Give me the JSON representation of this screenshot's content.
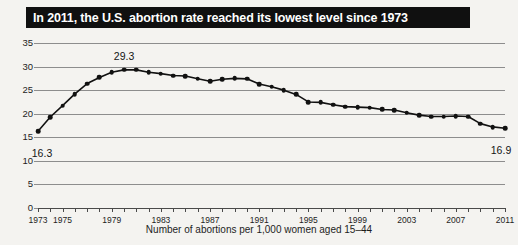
{
  "header": {
    "title": "In 2011, the U.S. abortion rate reached its lowest level since 1973"
  },
  "caption": "Number of abortions per 1,000 women aged 15–44",
  "annotations": {
    "first": "16.3",
    "peak": "29.3",
    "last": "16.9"
  },
  "colors": {
    "banner_background": "#101010",
    "banner_text": "#ffffff",
    "line": "#111111",
    "gridline": "#8d8d8d",
    "page_background": "#f4f3f0"
  },
  "chart_data": {
    "type": "line",
    "title": "In 2011, the U.S. abortion rate reached its lowest level since 1973",
    "xlabel": "Number of abortions per 1,000 women aged 15–44",
    "ylabel": "",
    "ylim": [
      0,
      35
    ],
    "yticks": [
      0,
      5,
      10,
      15,
      20,
      25,
      30,
      35
    ],
    "xlim": [
      1973,
      2011
    ],
    "xticks": [
      1973,
      1974,
      1975,
      1976,
      1977,
      1978,
      1979,
      1980,
      1981,
      1982,
      1983,
      1984,
      1985,
      1986,
      1987,
      1988,
      1989,
      1990,
      1991,
      1992,
      1993,
      1994,
      1995,
      1996,
      1997,
      1998,
      1999,
      2000,
      2001,
      2002,
      2003,
      2004,
      2005,
      2006,
      2007,
      2008,
      2009,
      2010,
      2011
    ],
    "xtick_labels": [
      1973,
      1975,
      1979,
      1983,
      1987,
      1991,
      1995,
      1999,
      2003,
      2007,
      2011
    ],
    "grid": true,
    "legend": false,
    "markers": true,
    "x": [
      1973,
      1974,
      1975,
      1976,
      1977,
      1978,
      1979,
      1980,
      1981,
      1982,
      1983,
      1984,
      1985,
      1986,
      1987,
      1988,
      1989,
      1990,
      1991,
      1992,
      1993,
      1994,
      1995,
      1996,
      1997,
      1998,
      1999,
      2000,
      2001,
      2002,
      2003,
      2004,
      2005,
      2006,
      2007,
      2008,
      2009,
      2010,
      2011
    ],
    "values": [
      16.3,
      19.3,
      21.7,
      24.2,
      26.4,
      27.7,
      28.8,
      29.3,
      29.3,
      28.8,
      28.5,
      28.1,
      28.0,
      27.4,
      26.9,
      27.3,
      27.5,
      27.4,
      26.3,
      25.7,
      25.0,
      24.1,
      22.5,
      22.4,
      21.9,
      21.5,
      21.4,
      21.3,
      20.9,
      20.8,
      20.2,
      19.7,
      19.4,
      19.4,
      19.5,
      19.4,
      17.9,
      17.2,
      16.9
    ],
    "annotated_points": [
      {
        "x": 1973,
        "value": 16.3,
        "label": "16.3"
      },
      {
        "x": 1980,
        "value": 29.3,
        "label": "29.3"
      },
      {
        "x": 2011,
        "value": 16.9,
        "label": "16.9"
      }
    ]
  }
}
